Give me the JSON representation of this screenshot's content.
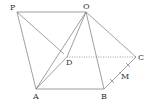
{
  "diagram": {
    "type": "geometry-solid",
    "points": {
      "P": {
        "label": "P",
        "x": 17,
        "y": 12,
        "lx": 10,
        "ly": 10
      },
      "O": {
        "label": "O",
        "x": 86,
        "y": 12,
        "lx": 83,
        "ly": 9
      },
      "A": {
        "label": "A",
        "x": 36,
        "y": 89,
        "lx": 33,
        "ly": 99
      },
      "B": {
        "label": "B",
        "x": 104,
        "y": 89,
        "lx": 101,
        "ly": 99
      },
      "C": {
        "label": "C",
        "x": 136,
        "y": 57,
        "lx": 138,
        "ly": 60
      },
      "D": {
        "label": "D",
        "x": 67,
        "y": 57,
        "lx": 66,
        "ly": 65
      },
      "M": {
        "label": "M",
        "x": 120,
        "y": 73,
        "lx": 121,
        "ly": 79
      }
    },
    "solid_edges": [
      [
        "P",
        "O"
      ],
      [
        "P",
        "A"
      ],
      [
        "A",
        "B"
      ],
      [
        "O",
        "A"
      ],
      [
        "O",
        "B"
      ],
      [
        "O",
        "C"
      ],
      [
        "B",
        "C"
      ],
      [
        "O",
        "D"
      ],
      [
        "A",
        "D"
      ],
      [
        "P",
        "D"
      ]
    ],
    "dashed_edges": [
      [
        "D",
        "C"
      ]
    ],
    "tick_marks_on": [
      "B",
      "C"
    ],
    "labels": [
      "P",
      "O",
      "A",
      "B",
      "C",
      "D",
      "M"
    ]
  }
}
